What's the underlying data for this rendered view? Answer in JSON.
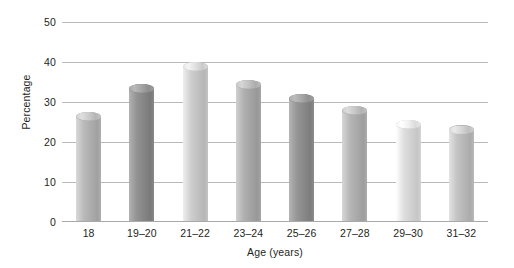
{
  "chart_data": {
    "type": "bar",
    "title": "",
    "subtitle": "",
    "xlabel": "Age (years)",
    "ylabel": "Percentage",
    "categories": [
      "18",
      "19–20",
      "21–22",
      "23–24",
      "25–26",
      "27–28",
      "29–30",
      "31–32"
    ],
    "values": [
      27.5,
      34.5,
      40,
      35.5,
      32,
      29,
      25.5,
      24
    ],
    "series": [
      {
        "name": "Percentage",
        "values": [
          27.5,
          34.5,
          40,
          35.5,
          32,
          29,
          25.5,
          24
        ]
      }
    ],
    "ylim": [
      0,
      50
    ],
    "yticks": [
      0,
      10,
      20,
      30,
      40,
      50
    ],
    "ytick_labels": [
      "0",
      "10",
      "20",
      "30",
      "40",
      "50"
    ],
    "grid": true,
    "grid_axis": "y",
    "legend": false,
    "legend_position": "none",
    "bar_style": "cylinder",
    "bar_colors": [
      "#b3b3b3",
      "#8c8c8c",
      "#c8c8c8",
      "#aaaaaa",
      "#8f8f8f",
      "#b0b0b0",
      "#d8d8d8",
      "#bdbdbd"
    ],
    "grid_color": "#b9b9b9",
    "background_color": "#ffffff",
    "text_color": "#231f20"
  },
  "axes": {
    "y_title": "Percentage",
    "x_title": "Age (years)"
  }
}
